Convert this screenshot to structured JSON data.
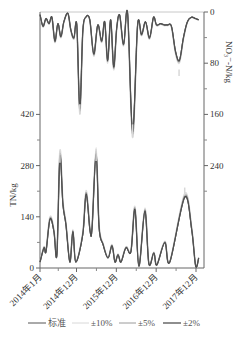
{
  "chart_data": {
    "type": "line",
    "title": "",
    "xlabel": "",
    "x_ticks": [
      "2014年1月",
      "2014年12月",
      "2015年12月",
      "2016年12月",
      "2017年12月"
    ],
    "x_tick_months": [
      0,
      11,
      23,
      35,
      47
    ],
    "x_range_months": [
      0,
      48
    ],
    "left_axis": {
      "label": "TN/kg",
      "ticks": [
        0,
        140,
        280,
        420
      ],
      "range": [
        0,
        700
      ]
    },
    "right_axis": {
      "label": "NO₃⁻-N/kg",
      "ticks": [
        0,
        80,
        160,
        240
      ],
      "range": [
        0,
        400
      ],
      "inverted": true
    },
    "legend": [
      {
        "name": "标准",
        "color": "#555555"
      },
      {
        "name": "±10%",
        "color": "#d8d8d8"
      },
      {
        "name": "±5%",
        "color": "#9a9a9a"
      },
      {
        "name": "±2%",
        "color": "#444444"
      }
    ],
    "legend_position": "bottom",
    "series_TN": {
      "axis": "left",
      "x": [
        0,
        1.2,
        1.8,
        3,
        4.2,
        5.1,
        6,
        6.9,
        7.8,
        9,
        9.9,
        10.8,
        12.9,
        13.9,
        15.1,
        15.7,
        16.9,
        17.8,
        19,
        20.5,
        21.7,
        22.6,
        23.5,
        24.4,
        25.9,
        27.4,
        28.6,
        29.8,
        31.6,
        32.8,
        34.3,
        35.2,
        37.6,
        39.1,
        43.6,
        45.7,
        46.9,
        47.8
      ],
      "标准": [
        16,
        55,
        44,
        132,
        99,
        36,
        302,
        173,
        118,
        16,
        99,
        16,
        91,
        200,
        99,
        110,
        310,
        110,
        63,
        27,
        60,
        16,
        36,
        16,
        55,
        44,
        159,
        5,
        154,
        11,
        41,
        8,
        69,
        16,
        192,
        104,
        5,
        27
      ],
      "±10%_peak_max": [
        320,
        325,
        220
      ],
      "±10%_peak_months": [
        6,
        16.9,
        43.6
      ]
    },
    "series_NO3": {
      "axis": "right",
      "x": [
        0,
        0.9,
        1.8,
        2.7,
        3.6,
        4.5,
        5.4,
        6.3,
        7.2,
        8.4,
        9.3,
        10.2,
        11.1,
        12,
        12.9,
        13.8,
        15,
        16.2,
        17.4,
        18.6,
        19.5,
        20.4,
        21.3,
        22.2,
        23.1,
        24,
        25.2,
        26.4,
        27.9,
        29.4,
        30.6,
        31.8,
        33,
        34.2,
        35.1,
        36.3,
        37.5,
        38.4,
        39.6,
        40.8,
        42,
        43.2,
        44.4,
        45.6,
        46.8,
        47.8
      ],
      "标准": [
        4,
        22,
        10,
        18,
        8,
        45,
        18,
        38,
        15,
        2,
        28,
        40,
        20,
        150,
        30,
        8,
        12,
        65,
        20,
        45,
        15,
        75,
        12,
        85,
        25,
        5,
        50,
        2,
        185,
        20,
        35,
        15,
        40,
        8,
        20,
        18,
        20,
        20,
        22,
        60,
        75,
        40,
        15,
        8,
        10,
        12
      ],
      "±10%_dip_max": [
        160,
        195,
        100
      ],
      "±10%_dip_months": [
        12,
        27.9,
        41.9
      ]
    }
  }
}
